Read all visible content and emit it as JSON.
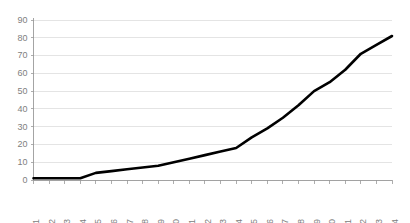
{
  "chart_data": {
    "type": "line",
    "title": "",
    "subtitle": "",
    "xlabel": "",
    "ylabel": "",
    "grid": true,
    "legend": false,
    "legend_position": "none",
    "line_color": "#000000",
    "gridline_color": "#d9d9d9",
    "axis_color": "#9a9a9a",
    "tick_label_color": "#808080",
    "background_color": "#ffffff",
    "ylim": [
      0,
      90
    ],
    "ytick_step": 10,
    "y_ticks": [
      "0",
      "10",
      "20",
      "30",
      "40",
      "50",
      "60",
      "70",
      "80",
      "90"
    ],
    "categories": [
      "1991",
      "1992",
      "1993",
      "1994",
      "1995",
      "1996",
      "1997",
      "1998",
      "1999",
      "2000",
      "2001",
      "2002",
      "2003",
      "2004",
      "2005",
      "2006",
      "2007",
      "2008",
      "2009",
      "2010",
      "2011",
      "2012",
      "2013",
      "2014"
    ],
    "values": [
      1,
      1,
      1,
      1,
      4,
      5,
      6,
      7,
      8,
      10,
      12,
      14,
      16,
      18,
      24,
      29,
      35,
      42,
      50,
      55,
      62,
      71,
      76,
      81
    ],
    "series": [
      {
        "name": "series-1",
        "values": [
          1,
          1,
          1,
          1,
          4,
          5,
          6,
          7,
          8,
          10,
          12,
          14,
          16,
          18,
          24,
          29,
          35,
          42,
          50,
          55,
          62,
          71,
          76,
          81
        ]
      }
    ]
  }
}
